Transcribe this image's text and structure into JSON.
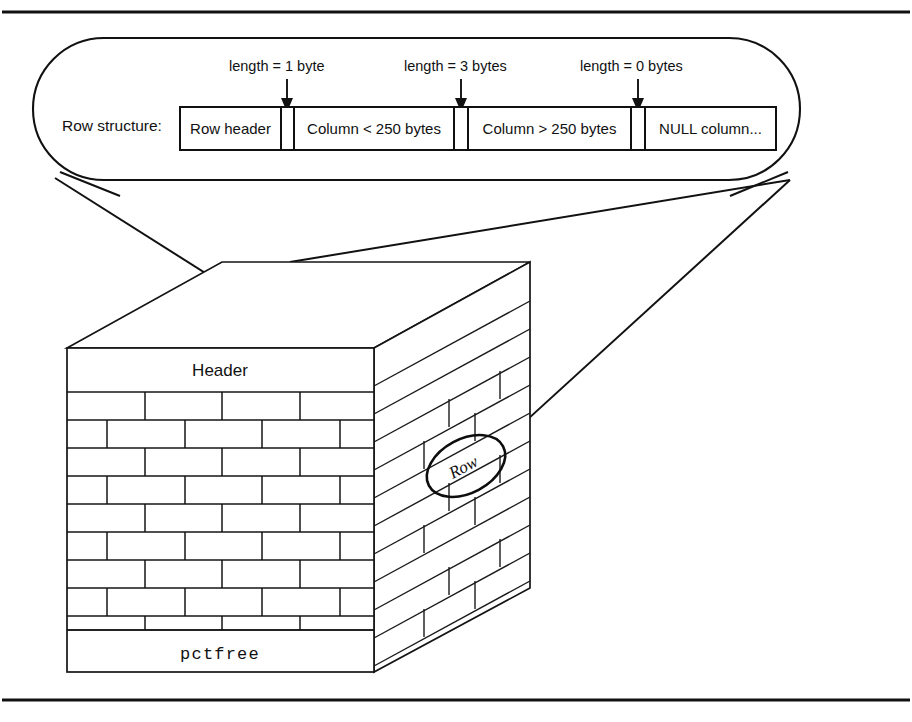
{
  "figure": {
    "stroke_color": "#111111",
    "background_color": "#ffffff"
  },
  "callout": {
    "label": "Row structure:",
    "annotations": [
      {
        "name": "length-1-byte",
        "text": "length = 1 byte"
      },
      {
        "name": "length-3-bytes",
        "text": "length = 3 bytes"
      },
      {
        "name": "length-0-bytes",
        "text": "length = 0 bytes"
      }
    ],
    "segments": [
      {
        "name": "row-header",
        "label": "Row header",
        "kind": "wide"
      },
      {
        "name": "length-byte-1",
        "label": "",
        "kind": "narrow"
      },
      {
        "name": "column-under-250",
        "label": "Column < 250 bytes",
        "kind": "wide"
      },
      {
        "name": "length-byte-2",
        "label": "",
        "kind": "narrow"
      },
      {
        "name": "column-over-250",
        "label": "Column > 250 bytes",
        "kind": "wide"
      },
      {
        "name": "length-byte-3",
        "label": "",
        "kind": "narrow"
      },
      {
        "name": "null-column",
        "label": "NULL column...",
        "kind": "wide"
      }
    ]
  },
  "block": {
    "header_label": "Header",
    "pctfree_label": "pctfree",
    "row_label": "Row"
  }
}
